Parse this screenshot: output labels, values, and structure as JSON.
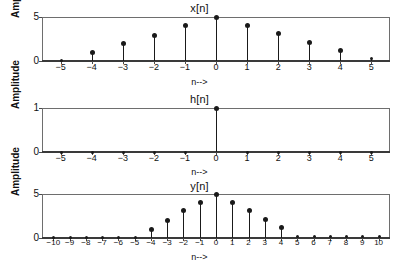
{
  "figure": {
    "background": "#ffffff",
    "accent": "#1a1a1a",
    "axis_color": "#6e6e6e",
    "xlabel": "n-->",
    "ylabel": "Amplitude"
  },
  "chart_data": [
    {
      "type": "scatter",
      "plot_style": "stem",
      "title": "x[n]",
      "xlabel": "n-->",
      "ylabel": "Amplitude",
      "x": [
        -5,
        -4,
        -3,
        -2,
        -1,
        0,
        1,
        2,
        3,
        4,
        5
      ],
      "values": [
        0.1,
        1.0,
        2.0,
        3.0,
        4.1,
        5.0,
        4.1,
        3.2,
        2.2,
        1.3,
        0.3
      ],
      "xtick_labels": [
        "−5",
        "−4",
        "−3",
        "−2",
        "−1",
        "0",
        "1",
        "2",
        "3",
        "4",
        "5"
      ],
      "ytick_labels": [
        "0",
        "5"
      ],
      "ytick_values": [
        0,
        5
      ],
      "xlim": [
        -5.6,
        5.6
      ],
      "ylim": [
        0,
        5
      ],
      "grid": false,
      "legend": false
    },
    {
      "type": "scatter",
      "plot_style": "stem",
      "title": "h[n]",
      "xlabel": "n-->",
      "ylabel": "Amplitude",
      "x": [
        -5,
        -4,
        -3,
        -2,
        -1,
        0,
        1,
        2,
        3,
        4,
        5
      ],
      "values": [
        0,
        0,
        0,
        0,
        0,
        1,
        0,
        0,
        0,
        0,
        0
      ],
      "xtick_labels": [
        "−5",
        "−4",
        "−3",
        "−2",
        "−1",
        "0",
        "1",
        "2",
        "3",
        "4",
        "5"
      ],
      "ytick_labels": [
        "0",
        "1"
      ],
      "ytick_values": [
        0,
        1
      ],
      "xlim": [
        -5.6,
        5.6
      ],
      "ylim": [
        0,
        1
      ],
      "grid": false,
      "legend": false
    },
    {
      "type": "scatter",
      "plot_style": "stem",
      "title": "y[n]",
      "xlabel": "n-->",
      "ylabel": "Amplitude",
      "x": [
        -10,
        -9,
        -8,
        -7,
        -6,
        -5,
        -4,
        -3,
        -2,
        -1,
        0,
        1,
        2,
        3,
        4,
        5,
        6,
        7,
        8,
        9,
        10
      ],
      "values": [
        0.1,
        0.1,
        0.1,
        0.1,
        0.1,
        0.1,
        1.0,
        2.0,
        3.2,
        4.1,
        5.0,
        4.1,
        3.2,
        2.2,
        1.2,
        0.2,
        0.2,
        0.2,
        0.2,
        0.2,
        0.2
      ],
      "xtick_labels": [
        "−10",
        "−9",
        "−8",
        "−7",
        "−6",
        "−5",
        "−4",
        "−3",
        "−2",
        "−1",
        "0",
        "1",
        "2",
        "3",
        "4",
        "5",
        "6",
        "7",
        "8",
        "9",
        "10"
      ],
      "ytick_labels": [
        "0",
        "5"
      ],
      "ytick_values": [
        0,
        5
      ],
      "xlim": [
        -10.7,
        10.7
      ],
      "ylim": [
        0,
        5
      ],
      "grid": false,
      "legend": false
    }
  ]
}
